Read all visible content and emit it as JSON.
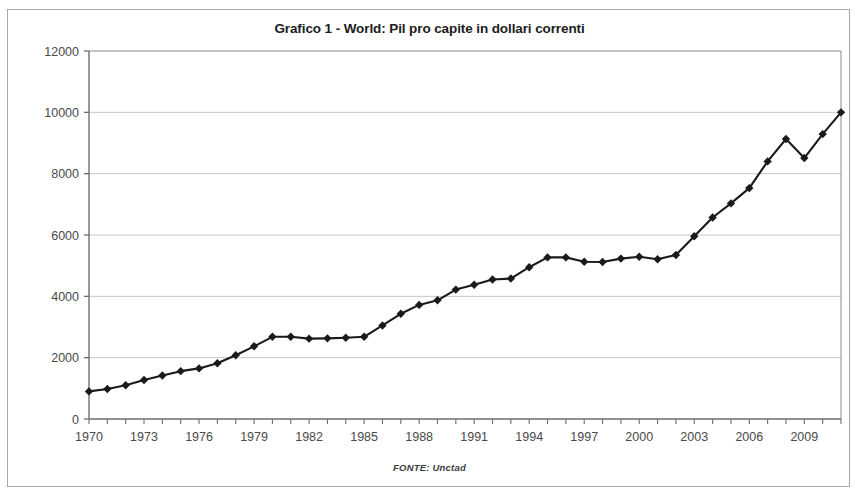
{
  "figure": {
    "title": "Grafico 1 - World: Pil pro capite in dollari correnti",
    "source_note": "FONTE: Unctad"
  },
  "chart_data": {
    "type": "line",
    "title": "Grafico 1 - World: Pil pro capite in dollari correnti",
    "subtitle": "",
    "xlabel": "",
    "ylabel": "",
    "source": "FONTE: Unctad",
    "grid": true,
    "legend": false,
    "marker": "diamond",
    "line_color": "#1a1a1a",
    "xlim": [
      1970,
      2011
    ],
    "ylim": [
      0,
      12000
    ],
    "ytick_step": 2000,
    "ytick_labels": [
      "0",
      "2000",
      "4000",
      "6000",
      "8000",
      "10000",
      "12000"
    ],
    "ytick_values": [
      0,
      2000,
      4000,
      6000,
      8000,
      10000,
      12000
    ],
    "xtick_labels": [
      "1970",
      "1973",
      "1976",
      "1979",
      "1982",
      "1985",
      "1988",
      "1991",
      "1994",
      "1997",
      "2000",
      "2003",
      "2006",
      "2009"
    ],
    "xtick_values": [
      1970,
      1973,
      1976,
      1979,
      1982,
      1985,
      1988,
      1991,
      1994,
      1997,
      2000,
      2003,
      2006,
      2009
    ],
    "x": [
      1970,
      1971,
      1972,
      1973,
      1974,
      1975,
      1976,
      1977,
      1978,
      1979,
      1980,
      1981,
      1982,
      1983,
      1984,
      1985,
      1986,
      1987,
      1988,
      1989,
      1990,
      1991,
      1992,
      1993,
      1994,
      1995,
      1996,
      1997,
      1998,
      1999,
      2000,
      2001,
      2002,
      2003,
      2004,
      2005,
      2006,
      2007,
      2008,
      2009,
      2010,
      2011
    ],
    "values": [
      900,
      980,
      1100,
      1270,
      1420,
      1560,
      1650,
      1820,
      2080,
      2370,
      2680,
      2680,
      2620,
      2630,
      2650,
      2680,
      3050,
      3430,
      3720,
      3870,
      4220,
      4380,
      4550,
      4580,
      4950,
      5270,
      5270,
      5130,
      5120,
      5230,
      5290,
      5210,
      5350,
      5960,
      6570,
      7030,
      7530,
      8400,
      9130,
      8510,
      9290,
      10000
    ],
    "series": [
      {
        "name": "Pil pro capite in dollari correnti",
        "values": [
          900,
          980,
          1100,
          1270,
          1420,
          1560,
          1650,
          1820,
          2080,
          2370,
          2680,
          2680,
          2620,
          2630,
          2650,
          2680,
          3050,
          3430,
          3720,
          3870,
          4220,
          4380,
          4550,
          4580,
          4950,
          5270,
          5270,
          5130,
          5120,
          5230,
          5290,
          5210,
          5350,
          5960,
          6570,
          7030,
          7530,
          8400,
          9130,
          8510,
          9290,
          10000
        ]
      }
    ]
  }
}
